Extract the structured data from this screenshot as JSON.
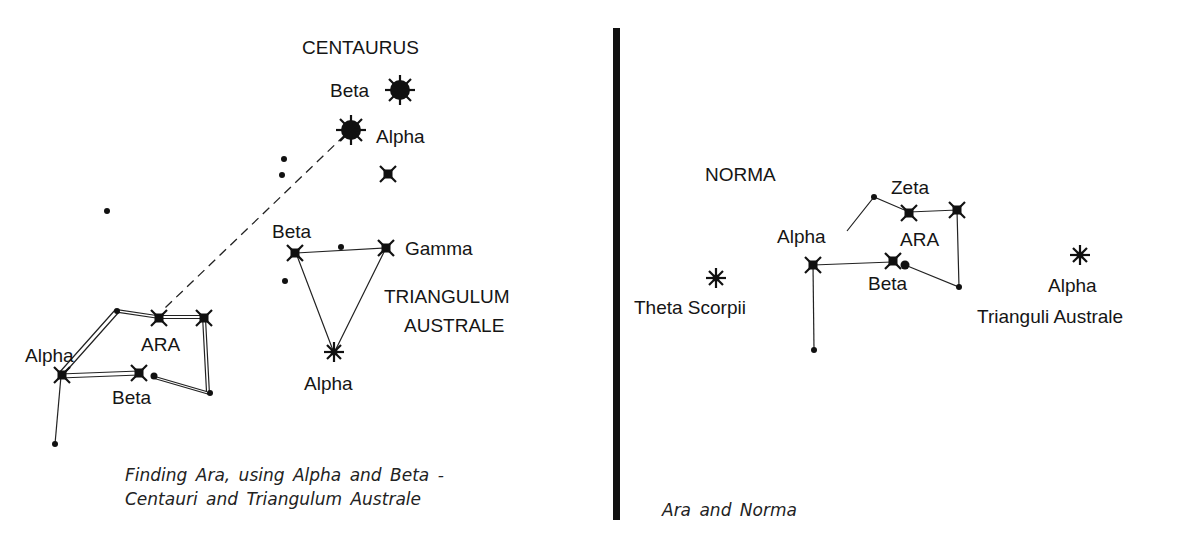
{
  "left_panel": {
    "labels": {
      "centaurus": "CENTAURUS",
      "cen_beta": "Beta",
      "cen_alpha": "Alpha",
      "tra_beta": "Beta",
      "tra_gamma": "Gamma",
      "tra_name_1": "TRIANGULUM",
      "tra_name_2": "AUSTRALE",
      "tra_alpha": "Alpha",
      "ara_alpha": "Alpha",
      "ara_name": "ARA",
      "ara_beta": "Beta"
    },
    "caption_line1": "Finding Ara, using Alpha and Beta -",
    "caption_line2": "Centauri and Triangulum Australe"
  },
  "right_panel": {
    "labels": {
      "norma": "NORMA",
      "zeta": "Zeta",
      "alpha": "Alpha",
      "ara": "ARA",
      "beta": "Beta",
      "theta_scorpii": "Theta Scorpii",
      "tra_alpha": "Alpha",
      "tra_alpha_sub": "Trianguli Australe"
    },
    "caption": "Ara and Norma"
  },
  "colors": {
    "ink": "#151515",
    "background": "#ffffff"
  }
}
